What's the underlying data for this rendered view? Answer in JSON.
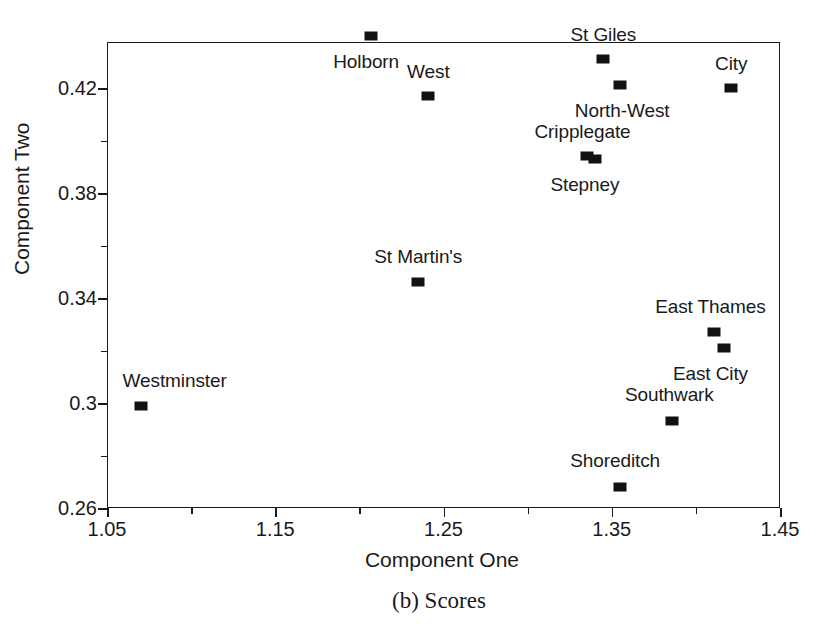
{
  "caption": "(b) Scores",
  "chart_data": {
    "type": "scatter",
    "title": "(b) Scores",
    "xlabel": "Component One",
    "ylabel": "Component Two",
    "xlim": [
      1.05,
      1.45
    ],
    "ylim": [
      0.26,
      0.44
    ],
    "grid": false,
    "legend": "none",
    "x_major_ticks": [
      1.05,
      1.15,
      1.25,
      1.35,
      1.45
    ],
    "x_minor_ticks": [
      1.1,
      1.2,
      1.3,
      1.4
    ],
    "x_tick_labels": [
      "1.05",
      "1.15",
      "1.25",
      "1.35",
      "1.45"
    ],
    "y_major_ticks": [
      0.26,
      0.3,
      0.34,
      0.38,
      0.42
    ],
    "y_minor_ticks": [
      0.28,
      0.32,
      0.36,
      0.4
    ],
    "y_tick_labels": [
      "0.26",
      "0.3",
      "0.34",
      "0.38",
      "0.42"
    ],
    "marker_style": "filled-square",
    "marker_color": "#111111",
    "points": [
      {
        "label": "Holborn",
        "x": 1.207,
        "y": 0.44,
        "label_dx": -5,
        "label_dy": 26
      },
      {
        "label": "West",
        "x": 1.241,
        "y": 0.417,
        "label_dx": 0,
        "label_dy": -24
      },
      {
        "label": "St Giles",
        "x": 1.345,
        "y": 0.431,
        "label_dx": 0,
        "label_dy": -24
      },
      {
        "label": "North-West",
        "x": 1.355,
        "y": 0.421,
        "label_dx": 2,
        "label_dy": 26
      },
      {
        "label": "City",
        "x": 1.421,
        "y": 0.42,
        "label_dx": 0,
        "label_dy": -24
      },
      {
        "label": "Cripplegate",
        "x": 1.335,
        "y": 0.394,
        "label_dx": -4,
        "label_dy": -24
      },
      {
        "label": "Stepney",
        "x": 1.34,
        "y": 0.393,
        "label_dx": -10,
        "label_dy": 26
      },
      {
        "label": "St Martin's",
        "x": 1.235,
        "y": 0.346,
        "label_dx": 0,
        "label_dy": -25
      },
      {
        "label": "East Thames",
        "x": 1.411,
        "y": 0.327,
        "label_dx": -4,
        "label_dy": -25
      },
      {
        "label": "East City",
        "x": 1.417,
        "y": 0.321,
        "label_dx": -14,
        "label_dy": 26
      },
      {
        "label": "Westminster",
        "x": 1.07,
        "y": 0.299,
        "label_dx": 34,
        "label_dy": -25
      },
      {
        "label": "Southwark",
        "x": 1.386,
        "y": 0.293,
        "label_dx": -3,
        "label_dy": -26
      },
      {
        "label": "Shoreditch",
        "x": 1.355,
        "y": 0.268,
        "label_dx": -5,
        "label_dy": -26
      }
    ]
  }
}
